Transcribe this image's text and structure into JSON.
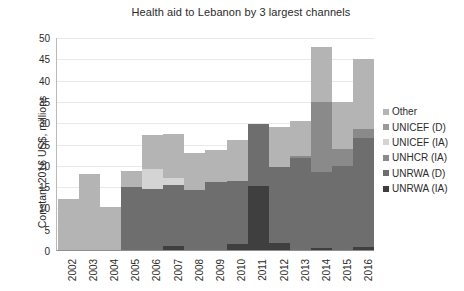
{
  "chart_data": {
    "type": "bar",
    "stacked": true,
    "title": "Health aid to Lebanon by 3 largest channels",
    "xlabel": "",
    "ylabel": "Constant 2016 US$, millions",
    "ylim": [
      0,
      50
    ],
    "yticks": [
      0,
      5,
      10,
      15,
      20,
      25,
      30,
      35,
      40,
      45,
      50
    ],
    "grid": true,
    "legend_position": "right",
    "categories": [
      "2002",
      "2003",
      "2004",
      "2005",
      "2006",
      "2007",
      "2008",
      "2009",
      "2010",
      "2011",
      "2012",
      "2013",
      "2014",
      "2015",
      "2016"
    ],
    "series": [
      {
        "name": "UNRWA (IA)",
        "color": "#3f3f3f",
        "values": [
          0,
          0,
          0,
          0,
          0,
          1.0,
          0,
          0,
          1.5,
          15.0,
          1.6,
          0,
          0.4,
          0,
          0.8
        ]
      },
      {
        "name": "UNRWA (D)",
        "color": "#6e6e6e",
        "values": [
          0,
          0,
          0,
          14.8,
          14.3,
          14.3,
          14.0,
          16.0,
          14.8,
          14.5,
          18.0,
          21.5,
          17.8,
          19.7,
          25.5
        ]
      },
      {
        "name": "UNHCR (IA)",
        "color": "#8a8a8a",
        "values": [
          0,
          0,
          0,
          0,
          0,
          0,
          0,
          0,
          0,
          0,
          0,
          0.6,
          16.6,
          3.9,
          2.2
        ]
      },
      {
        "name": "UNICEF (IA)",
        "color": "#d4d4d4",
        "values": [
          0,
          0,
          0,
          0,
          4.7,
          1.5,
          0,
          0,
          0,
          0,
          0,
          0,
          0,
          0,
          0
        ]
      },
      {
        "name": "UNICEF (D)",
        "color": "#9a9a9a",
        "values": [
          0,
          0,
          0,
          0,
          0,
          0,
          0,
          0,
          0,
          0,
          0,
          0,
          0,
          0,
          0
        ]
      },
      {
        "name": "Other",
        "color": "#b4b4b4",
        "values": [
          12.0,
          17.8,
          10.2,
          3.7,
          8.0,
          10.5,
          8.7,
          7.5,
          9.5,
          0,
          9.3,
          8.1,
          12.8,
          11.2,
          16.3
        ]
      }
    ],
    "totals": [
      12.0,
      17.8,
      10.2,
      18.5,
      27.0,
      27.6,
      22.7,
      23.5,
      25.8,
      29.5,
      28.9,
      30.2,
      47.6,
      34.8,
      44.8
    ]
  },
  "legend": {
    "items": [
      {
        "label": "Other",
        "color": "#b4b4b4"
      },
      {
        "label": "UNICEF (D)",
        "color": "#9a9a9a"
      },
      {
        "label": "UNICEF (IA)",
        "color": "#d4d4d4"
      },
      {
        "label": "UNHCR (IA)",
        "color": "#8a8a8a"
      },
      {
        "label": "UNRWA (D)",
        "color": "#6e6e6e"
      },
      {
        "label": "UNRWA (IA)",
        "color": "#3f3f3f"
      }
    ]
  }
}
